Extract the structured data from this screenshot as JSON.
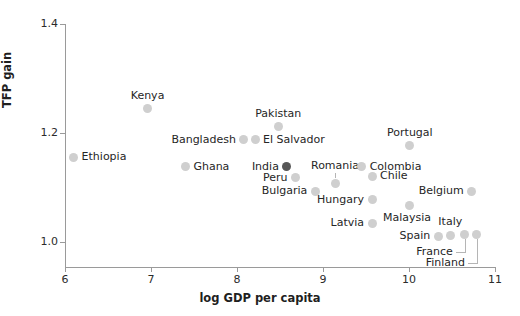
{
  "chart_data": {
    "type": "scatter",
    "title": "",
    "xlabel": "log GDP per capita",
    "ylabel": "TFP gain",
    "xlim": [
      6,
      11
    ],
    "ylim": [
      0.955,
      1.4
    ],
    "xticks": [
      6,
      7,
      8,
      9,
      10,
      11
    ],
    "xticklabels": [
      "6",
      "7",
      "8",
      "9",
      "10",
      "11"
    ],
    "yticks": [
      1.0,
      1.2,
      1.4
    ],
    "yticklabels": [
      "1.0",
      "1.2",
      "1.4"
    ],
    "grid": false,
    "legend": null,
    "point_color": "#cfcfcf",
    "highlight_color": "#575757",
    "points": [
      {
        "label": "Ethiopia",
        "x": 6.1,
        "y": 1.156,
        "label_pos": "right",
        "highlight": false
      },
      {
        "label": "Kenya",
        "x": 6.96,
        "y": 1.245,
        "label_pos": "above",
        "highlight": false
      },
      {
        "label": "Ghana",
        "x": 7.4,
        "y": 1.139,
        "label_pos": "right",
        "highlight": false
      },
      {
        "label": "Bangladesh",
        "x": 8.08,
        "y": 1.188,
        "label_pos": "left",
        "highlight": false
      },
      {
        "label": "El Salvador",
        "x": 8.21,
        "y": 1.188,
        "label_pos": "right",
        "highlight": false
      },
      {
        "label": "Pakistan",
        "x": 8.48,
        "y": 1.212,
        "label_pos": "above",
        "highlight": false
      },
      {
        "label": "India",
        "x": 8.58,
        "y": 1.139,
        "label_pos": "left",
        "highlight": true
      },
      {
        "label": "Peru",
        "x": 8.68,
        "y": 1.118,
        "label_pos": "left",
        "highlight": false
      },
      {
        "label": "Bulgaria",
        "x": 8.91,
        "y": 1.094,
        "label_pos": "left",
        "highlight": false
      },
      {
        "label": "Romania",
        "x": 9.14,
        "y": 1.108,
        "label_pos": "above",
        "highlight": false
      },
      {
        "label": "Colombia",
        "x": 9.45,
        "y": 1.139,
        "label_pos": "right",
        "highlight": false
      },
      {
        "label": "Chile",
        "x": 9.57,
        "y": 1.121,
        "label_pos": "right",
        "highlight": false
      },
      {
        "label": "Hungary",
        "x": 9.57,
        "y": 1.078,
        "label_pos": "left",
        "highlight": false
      },
      {
        "label": "Latvia",
        "x": 9.57,
        "y": 1.035,
        "label_pos": "left",
        "highlight": false
      },
      {
        "label": "Portugal",
        "x": 10.01,
        "y": 1.177,
        "label_pos": "above",
        "highlight": false
      },
      {
        "label": "Malaysia",
        "x": 10.0,
        "y": 1.068,
        "label_pos": "below-left",
        "highlight": false
      },
      {
        "label": "Belgium",
        "x": 10.73,
        "y": 1.094,
        "label_pos": "left",
        "highlight": false
      },
      {
        "label": "Spain",
        "x": 10.34,
        "y": 1.011,
        "label_pos": "left",
        "highlight": false
      },
      {
        "label": "Italy",
        "x": 10.48,
        "y": 1.013,
        "label_pos": "above",
        "highlight": false
      },
      {
        "label": "France",
        "x": 10.65,
        "y": 1.015,
        "label_pos": "leader",
        "highlight": false
      },
      {
        "label": "Finland",
        "x": 10.79,
        "y": 1.015,
        "label_pos": "leader",
        "highlight": false
      }
    ]
  }
}
